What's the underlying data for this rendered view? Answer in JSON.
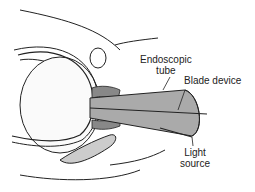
{
  "figure": {
    "labels": {
      "endoscopic_tube": [
        "Endoscopic",
        "tube"
      ],
      "blade_device": "Blade device",
      "light_source": [
        "Light",
        "source"
      ]
    },
    "colors": {
      "line": "#222222",
      "tube_fill": "#aaaaaa",
      "background": "#ffffff"
    }
  }
}
